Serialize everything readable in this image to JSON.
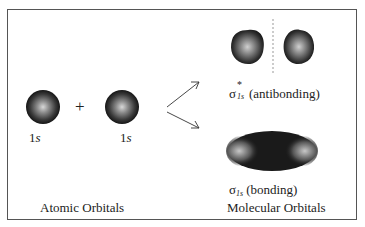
{
  "diagram": {
    "atomic": {
      "orbital_left_label_num": "1",
      "orbital_left_label_s": "s",
      "orbital_right_label_num": "1",
      "orbital_right_label_s": "s",
      "plus": "+",
      "caption": "Atomic Orbitals"
    },
    "molecular": {
      "antibonding_symbol": "σ",
      "antibonding_sup": "*",
      "antibonding_sub": "1s",
      "antibonding_text": "(antibonding)",
      "bonding_symbol": "σ",
      "bonding_sub": "1s",
      "bonding_text": "(bonding)",
      "caption": "Molecular Orbitals"
    },
    "colors": {
      "frame": "#555555",
      "orbital_dark": "#1a1a1a",
      "orbital_light": "#d8d8d8",
      "node_line": "#999999"
    }
  }
}
